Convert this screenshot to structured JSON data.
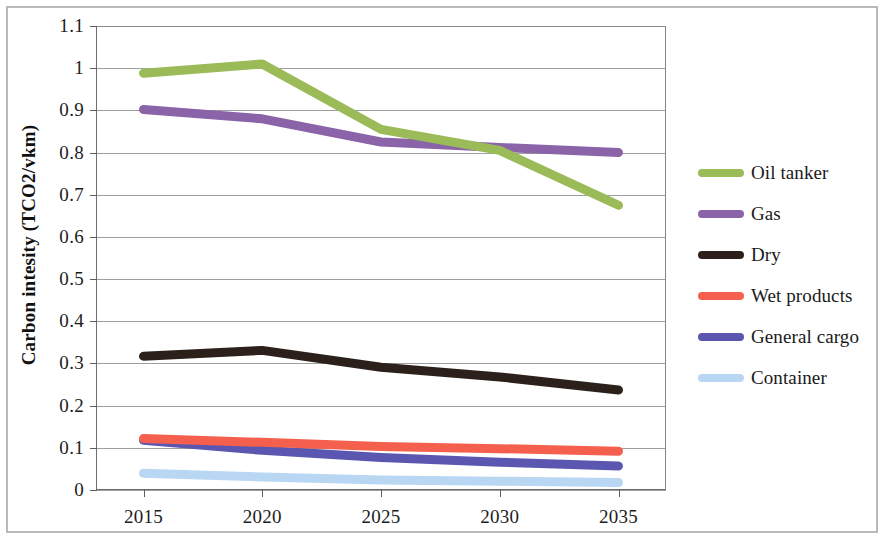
{
  "chart_data": {
    "type": "line",
    "title": "",
    "xlabel": "",
    "ylabel": "Carbon intesity (TCO2/vkm)",
    "categories": [
      "2015",
      "2020",
      "2025",
      "2030",
      "2035"
    ],
    "x": [
      2015,
      2020,
      2025,
      2030,
      2035
    ],
    "xlim": [
      2013,
      2037
    ],
    "ylim": [
      0,
      1.1
    ],
    "ytick_values": [
      0,
      0.1,
      0.2,
      0.3,
      0.4,
      0.5,
      0.6,
      0.7,
      0.8,
      0.9,
      1.0,
      1.1
    ],
    "ytick_labels": [
      "0",
      "0.1",
      "0.2",
      "0.3",
      "0.4",
      "0.5",
      "0.6",
      "0.7",
      "0.8",
      "0.9",
      "1",
      "1.1"
    ],
    "grid": true,
    "legend_position": "right",
    "series": [
      {
        "name": "Oil tanker",
        "color": "#9BBB59",
        "values": [
          0.988,
          1.01,
          0.855,
          0.805,
          0.675
        ]
      },
      {
        "name": "Gas",
        "color": "#8A63A8",
        "values": [
          0.902,
          0.88,
          0.825,
          0.812,
          0.8
        ]
      },
      {
        "name": "Dry",
        "color": "#2B211A",
        "values": [
          0.317,
          0.331,
          0.291,
          0.268,
          0.237
        ]
      },
      {
        "name": "Wet products",
        "color": "#F4604D",
        "values": [
          0.122,
          0.113,
          0.103,
          0.098,
          0.092
        ]
      },
      {
        "name": "General cargo",
        "color": "#5B57B0",
        "values": [
          0.118,
          0.094,
          0.077,
          0.066,
          0.057
        ]
      },
      {
        "name": "Container",
        "color": "#B9D7F2",
        "values": [
          0.04,
          0.031,
          0.024,
          0.021,
          0.018
        ]
      }
    ]
  },
  "legend": {
    "items": [
      {
        "label": "Oil tanker"
      },
      {
        "label": "Gas"
      },
      {
        "label": "Dry"
      },
      {
        "label": "Wet products"
      },
      {
        "label": "General cargo"
      },
      {
        "label": "Container"
      }
    ]
  },
  "axes": {
    "y_title": "Carbon intesity (TCO2/vkm)"
  }
}
